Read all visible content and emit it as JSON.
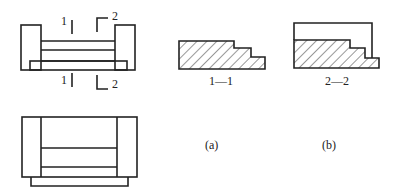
{
  "figure": {
    "plan_top": {
      "cut_marks": [
        {
          "label": "1",
          "position": "top"
        },
        {
          "label": "2",
          "position": "top"
        },
        {
          "label": "1",
          "position": "bottom"
        },
        {
          "label": "2",
          "position": "bottom"
        }
      ]
    },
    "section_1_1": {
      "caption": "1—1"
    },
    "section_2_2": {
      "caption": "2—2"
    },
    "subfig_a": {
      "caption": "(a)"
    },
    "subfig_b": {
      "caption": "(b)"
    }
  },
  "colors": {
    "stroke": "#222222",
    "background": "#ffffff"
  }
}
